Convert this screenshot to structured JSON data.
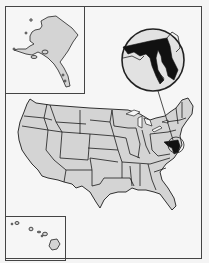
{
  "map": {
    "type": "locator-map",
    "subject_region": "United States",
    "highlighted_state": "Maryland",
    "insets": [
      {
        "name": "Alaska"
      },
      {
        "name": "Hawaii"
      },
      {
        "name": "Maryland callout"
      }
    ],
    "colors": {
      "background": "#f6f6f6",
      "state_fill": "#d4d4d4",
      "border": "#1c1c1c",
      "highlight": "#111111",
      "frame": "#444444"
    }
  }
}
